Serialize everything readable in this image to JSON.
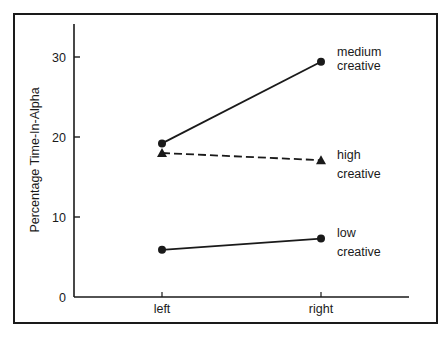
{
  "chart_data": {
    "type": "line",
    "title": "",
    "xlabel": "",
    "ylabel": "Percentage Time-In-Alpha",
    "categories": [
      "left",
      "right"
    ],
    "ylim": [
      0,
      34
    ],
    "yticks": [
      0,
      10,
      20,
      30
    ],
    "grid": false,
    "legend": "inline labels at right end of lines",
    "series": [
      {
        "name": "medium creative",
        "label_lines": [
          "medium",
          "creative"
        ],
        "values": [
          19.2,
          29.4
        ],
        "marker": "circle",
        "line": "solid"
      },
      {
        "name": "high creative",
        "label_lines": [
          "high",
          "creative"
        ],
        "values": [
          18.0,
          17.1
        ],
        "marker": "triangle",
        "line": "dashed"
      },
      {
        "name": "low creative",
        "label_lines": [
          "low",
          "creative"
        ],
        "values": [
          5.9,
          7.3
        ],
        "marker": "circle",
        "line": "solid"
      }
    ]
  },
  "colors": {
    "ink": "#1a1a1a",
    "background": "#ffffff"
  }
}
